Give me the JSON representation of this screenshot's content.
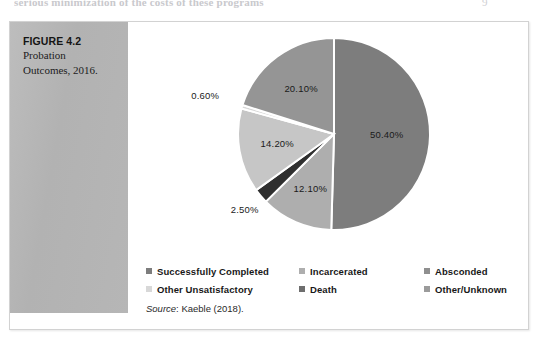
{
  "page": {
    "running_text": "serious minimization of the costs of these programs",
    "page_number": "9"
  },
  "figure": {
    "caption_title": "FIGURE 4.2",
    "caption_line1": "Probation",
    "caption_line2": "Outcomes, 2016.",
    "source_prefix": "Source",
    "source_text": ": Kaeble (2018)."
  },
  "chart_data": {
    "type": "pie",
    "title": "Probation Outcomes, 2016",
    "labels": [
      "Successfully Completed",
      "Incarcerated",
      "Death",
      "Absconded",
      "Other Unsatisfactory",
      "Other/Unknown"
    ],
    "values": [
      50.4,
      12.1,
      2.5,
      14.2,
      0.6,
      20.1
    ],
    "value_labels": [
      "50.40%",
      "12.10%",
      "2.50%",
      "14.20%",
      "0.60%",
      "20.10%"
    ],
    "colors": [
      "#7d7d7d",
      "#aeaeae",
      "#2f2f2f",
      "#c6c6c6",
      "#d8d8d8",
      "#959595"
    ],
    "start_angle_deg": 0,
    "direction": "clockwise",
    "units": "percent",
    "legend_position": "bottom",
    "grid": false,
    "source": "Kaeble (2018)."
  },
  "legend": {
    "rows": [
      [
        {
          "label": "Successfully Completed",
          "color": "#7d7d7d"
        },
        {
          "label": "Incarcerated",
          "color": "#aeaeae"
        },
        {
          "label": "Absconded",
          "color": "#8f8f8f"
        }
      ],
      [
        {
          "label": "Other Unsatisfactory",
          "color": "#d8d8d8"
        },
        {
          "label": "Death",
          "color": "#6e6e6e"
        },
        {
          "label": "Other/Unknown",
          "color": "#9b9b9b"
        }
      ]
    ]
  }
}
